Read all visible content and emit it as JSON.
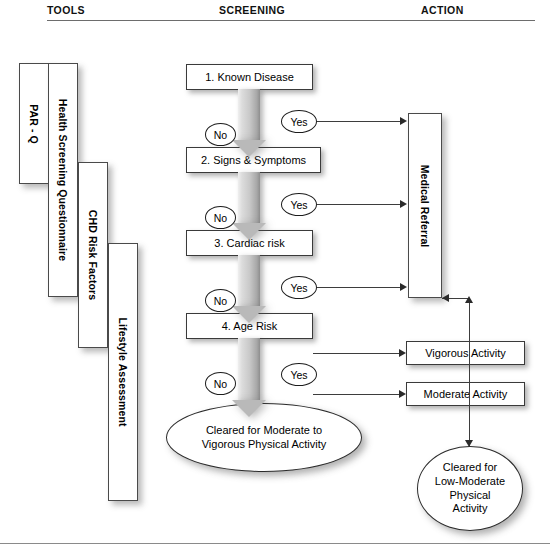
{
  "headers": {
    "tools": "TOOLS",
    "screening": "SCREENING",
    "action": "ACTION"
  },
  "tools": {
    "items": [
      {
        "label": "PAR - Q"
      },
      {
        "label": "Health Screening Questionnaire"
      },
      {
        "label": "CHD Risk Factors"
      },
      {
        "label": "Lifestyle Assessment"
      }
    ]
  },
  "screening": {
    "steps": [
      {
        "label": "1. Known Disease"
      },
      {
        "label": "2. Signs & Symptoms"
      },
      {
        "label": "3. Cardiac risk"
      },
      {
        "label": "4. Age Risk"
      }
    ],
    "no_labels": [
      "No",
      "No",
      "No",
      "No"
    ],
    "yes_labels": [
      "Yes",
      "Yes",
      "Yes",
      "Yes"
    ],
    "outcome": {
      "line1": "Cleared for Moderate to",
      "line2": "Vigorous Physical Activity"
    }
  },
  "action": {
    "medical_referral": "Medical Referral",
    "vigorous_activity": "Vigorous Activity",
    "moderate_activity": "Moderate Activity",
    "outcome": {
      "line1": "Cleared for",
      "line2": "Low-Moderate",
      "line3": "Physical",
      "line4": "Activity"
    }
  },
  "colors": {
    "arrow_light": "#efefef",
    "arrow_dark": "#8e8e8e",
    "line": "#3d3d3d",
    "box_border": "#3a3a3a",
    "text": "#000000"
  }
}
